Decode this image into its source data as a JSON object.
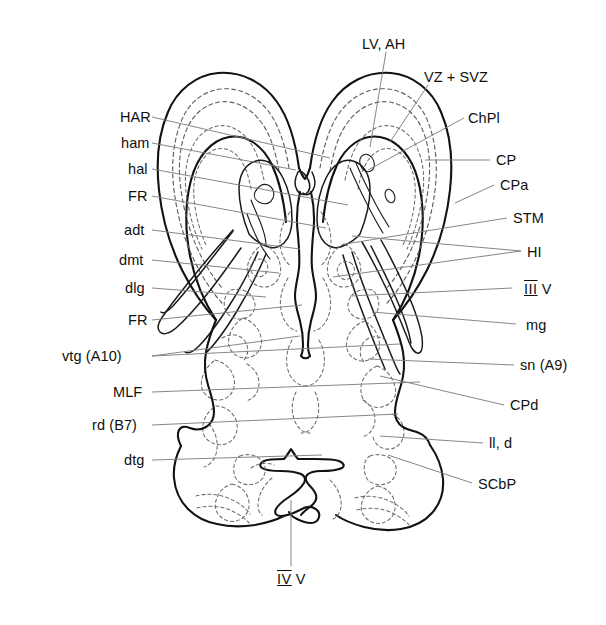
{
  "figure": {
    "type": "anatomical-schematic",
    "view": "horizontal (transverse) section, dorsal view",
    "line_colors": {
      "solid_outline": "#121212",
      "dashed_internal": "#5f5f5f",
      "leader_line": "#808080",
      "background": "#ffffff",
      "text": "#101010"
    }
  },
  "labels_left": [
    {
      "id": "har",
      "text": "HAR",
      "x": 120,
      "y": 110,
      "lx": 152,
      "ly": 117,
      "tx": 330,
      "ty": 158
    },
    {
      "id": "ham",
      "text": "ham",
      "x": 121,
      "y": 136,
      "lx": 152,
      "ly": 143,
      "tx": 296,
      "ty": 170
    },
    {
      "id": "hal",
      "text": "hal",
      "x": 128,
      "y": 162,
      "lx": 152,
      "ly": 169,
      "tx": 348,
      "ty": 205
    },
    {
      "id": "fr1",
      "text": "FR",
      "x": 128,
      "y": 189,
      "lx": 152,
      "ly": 196,
      "tx": 326,
      "ty": 228
    },
    {
      "id": "adt",
      "text": "adt",
      "x": 124,
      "y": 223,
      "lx": 152,
      "ly": 230,
      "tx": 300,
      "ty": 249
    },
    {
      "id": "dmt",
      "text": "dmt",
      "x": 119,
      "y": 253,
      "lx": 152,
      "ly": 260,
      "tx": 279,
      "ty": 273
    },
    {
      "id": "dlg",
      "text": "dlg",
      "x": 125,
      "y": 281,
      "lx": 152,
      "ly": 288,
      "tx": 266,
      "ty": 297
    },
    {
      "id": "fr2",
      "text": "FR",
      "x": 128,
      "y": 313,
      "lx": 152,
      "ly": 320,
      "tx": 302,
      "ty": 305
    },
    {
      "id": "vtg",
      "text": "vtg (A10)",
      "x": 62,
      "y": 349,
      "lx": 152,
      "ly": 356,
      "tx": 400,
      "ty": 344
    },
    {
      "id": "mlf",
      "text": "MLF",
      "x": 113,
      "y": 385,
      "lx": 152,
      "ly": 392,
      "tx": 420,
      "ty": 382
    },
    {
      "id": "rd",
      "text": "rd (B7)",
      "x": 92,
      "y": 418,
      "lx": 152,
      "ly": 425,
      "tx": 398,
      "ty": 414
    },
    {
      "id": "dtg",
      "text": "dtg",
      "x": 124,
      "y": 453,
      "lx": 152,
      "ly": 460,
      "tx": 322,
      "ty": 455
    }
  ],
  "labels_right": [
    {
      "id": "cp",
      "text": "CP",
      "x": 496,
      "y": 153,
      "lx": 490,
      "ly": 160,
      "tx": 425,
      "ty": 160
    },
    {
      "id": "cpa",
      "text": "CPa",
      "x": 500,
      "y": 178,
      "lx": 494,
      "ly": 185,
      "tx": 455,
      "ty": 203
    },
    {
      "id": "stm",
      "text": "STM",
      "x": 513,
      "y": 211,
      "lx": 507,
      "ly": 218,
      "tx": 345,
      "ty": 244
    },
    {
      "id": "hi1",
      "text": "HI",
      "x": 527,
      "y": 245,
      "lx": 521,
      "ly": 251,
      "tx": 352,
      "ty": 236
    },
    {
      "id": "iiiv",
      "text": "III V",
      "x": 524,
      "y": 282,
      "lx": 512,
      "ly": 288,
      "tx": 350,
      "ty": 296,
      "roman": true
    },
    {
      "id": "mg",
      "text": "mg",
      "x": 526,
      "y": 318,
      "lx": 516,
      "ly": 324,
      "tx": 372,
      "ty": 312
    },
    {
      "id": "sn",
      "text": "sn (A9)",
      "x": 520,
      "y": 358,
      "lx": 514,
      "ly": 365,
      "tx": 368,
      "ty": 359
    },
    {
      "id": "cpd",
      "text": "CPd",
      "x": 510,
      "y": 398,
      "lx": 504,
      "ly": 405,
      "tx": 380,
      "ty": 376
    },
    {
      "id": "lld",
      "text": "ll, d",
      "x": 489,
      "y": 436,
      "lx": 483,
      "ly": 443,
      "tx": 380,
      "ty": 436
    },
    {
      "id": "scbp",
      "text": "SCbP",
      "x": 478,
      "y": 477,
      "lx": 472,
      "ly": 483,
      "tx": 388,
      "ty": 455
    }
  ],
  "labels_top": [
    {
      "id": "lvah",
      "text": "LV, AH",
      "x": 362,
      "y": 37,
      "lx": 386,
      "ly": 52,
      "tx": 370,
      "ty": 147
    },
    {
      "id": "vzsvz",
      "text": "VZ + SVZ",
      "x": 424,
      "y": 70,
      "lx": 428,
      "ly": 85,
      "tx": 390,
      "ty": 142
    }
  ],
  "labels_bottom": [
    {
      "id": "ivv",
      "text": "IV V",
      "x": 277,
      "y": 572,
      "lx": 291,
      "ly": 566,
      "tx": 291,
      "ty": 500,
      "roman": true
    }
  ],
  "abbreviations": {
    "HAR": "hippocampal anlage / rudiment",
    "ham": "hippocampus, medial",
    "hal": "hippocampus, lateral",
    "FR": "fasciculus retroflexus",
    "adt": "anterodorsal thalamic nucleus",
    "dmt": "dorsomedial thalamic nucleus",
    "dlg": "dorsal lateral geniculate",
    "vtg (A10)": "ventral tegmental area (A10)",
    "MLF": "medial longitudinal fasciculus",
    "rd (B7)": "raphe dorsalis (B7)",
    "dtg": "dorsal tegmental nucleus",
    "LV, AH": "lateral ventricle, anterior horn",
    "VZ + SVZ": "ventricular zone + subventricular zone",
    "ChPl": "choroid plexus",
    "CP": "cortical plate",
    "CPa": "cortical plate, anterior",
    "STM": "stria terminalis",
    "HI": "hippocampus",
    "III V": "third ventricle",
    "mg": "medial geniculate",
    "sn (A9)": "substantia nigra (A9)",
    "CPd": "cerebral peduncle",
    "ll, d": "lateral lemniscus, dorsal nucleus",
    "SCbP": "superior cerebellar peduncle",
    "IV V": "fourth ventricle"
  },
  "chpl": {
    "id": "chpl",
    "text": "ChPl",
    "x": 468,
    "y": 111,
    "lx": 464,
    "ly": 118,
    "tx": 368,
    "ty": 170
  }
}
